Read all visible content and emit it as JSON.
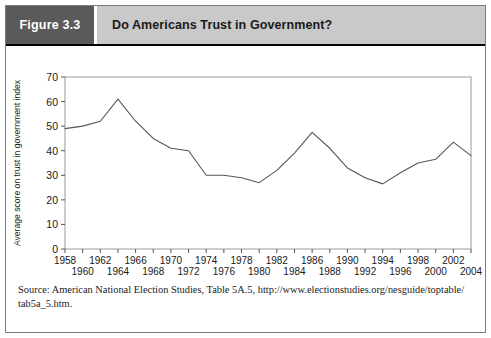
{
  "header": {
    "figure_label": "Figure 3.3",
    "title": "Do Americans Trust in Government?",
    "badge_color": "#5a5a5a",
    "title_bg_color": "#c9c9c9"
  },
  "source": {
    "line1": "Source: American National Election Studies, Table 5A.5, http://www.electionstudies.org/nesguide/toptable/",
    "line2": "tab5a_5.htm."
  },
  "chart_data": {
    "type": "line",
    "title": "Do Americans Trust in Government?",
    "xlabel": "",
    "ylabel": "Average score on trust in government index",
    "xlim": [
      1958,
      2004
    ],
    "ylim": [
      0,
      70
    ],
    "ytick_step": 10,
    "yticks": [
      0,
      10,
      20,
      30,
      40,
      50,
      60,
      70
    ],
    "xticks": [
      1958,
      1960,
      1962,
      1964,
      1966,
      1968,
      1970,
      1972,
      1974,
      1976,
      1978,
      1980,
      1982,
      1984,
      1986,
      1988,
      1990,
      1992,
      1994,
      1996,
      1998,
      2000,
      2002,
      2004
    ],
    "xtick_labels_top": [
      "1958",
      "1966",
      "1970",
      "1974",
      "1978",
      "1982",
      "1986",
      "1990",
      "1994",
      "1998",
      "2002"
    ],
    "xtick_labels_bottom": [
      "1964",
      "1968",
      "1972",
      "1976",
      "1980",
      "1984",
      "1988",
      "1992",
      "1996",
      "2000",
      "2004"
    ],
    "grid": false,
    "legend": "none",
    "line_color": "#555555",
    "x": [
      1958,
      1960,
      1962,
      1964,
      1966,
      1968,
      1970,
      1972,
      1974,
      1976,
      1978,
      1980,
      1982,
      1984,
      1986,
      1988,
      1990,
      1992,
      1994,
      1996,
      1998,
      2000,
      2002,
      2004
    ],
    "values": [
      49,
      50,
      52,
      61,
      52,
      45,
      41,
      40,
      30,
      30,
      29,
      27,
      32,
      39,
      47.5,
      41,
      33,
      29,
      26.5,
      31,
      35,
      36.5,
      43.5,
      38
    ]
  }
}
